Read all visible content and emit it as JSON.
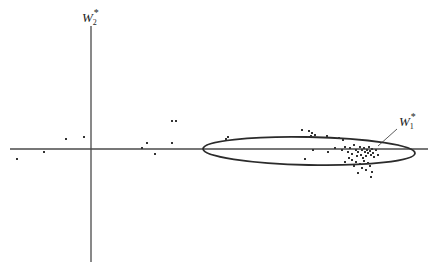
{
  "diagram": {
    "type": "scatter-with-ellipse",
    "axes": {
      "horizontal": {
        "x1": 10,
        "x2": 428,
        "y": 149
      },
      "vertical": {
        "x": 91,
        "y1": 26,
        "y2": 262
      },
      "vertical_label": {
        "base": "W",
        "sub": "2",
        "sup": "*"
      }
    },
    "ellipse": {
      "cx": 309,
      "cy": 151,
      "rx": 106,
      "ry": 14,
      "label": {
        "base": "W",
        "sub": "1",
        "sup": "*"
      },
      "pointer": {
        "from": [
          397,
          129
        ],
        "to": [
          378,
          146
        ]
      }
    },
    "points": [
      [
        17,
        159
      ],
      [
        44,
        152
      ],
      [
        66,
        139
      ],
      [
        84,
        137
      ],
      [
        142,
        148
      ],
      [
        147,
        143
      ],
      [
        155,
        154
      ],
      [
        172,
        143
      ],
      [
        172,
        121
      ],
      [
        176,
        121
      ],
      [
        226,
        139
      ],
      [
        228,
        137
      ],
      [
        302,
        130
      ],
      [
        309,
        131
      ],
      [
        312,
        133
      ],
      [
        311,
        136
      ],
      [
        308,
        137
      ],
      [
        315,
        135
      ],
      [
        327,
        136
      ],
      [
        339,
        138
      ],
      [
        343,
        140
      ],
      [
        313,
        150
      ],
      [
        305,
        159
      ],
      [
        328,
        152
      ],
      [
        335,
        148
      ],
      [
        342,
        150
      ],
      [
        345,
        147
      ],
      [
        348,
        152
      ],
      [
        350,
        148
      ],
      [
        352,
        154
      ],
      [
        354,
        145
      ],
      [
        356,
        150
      ],
      [
        357,
        156
      ],
      [
        358,
        152
      ],
      [
        360,
        147
      ],
      [
        361,
        155
      ],
      [
        362,
        150
      ],
      [
        363,
        158
      ],
      [
        364,
        148
      ],
      [
        365,
        152
      ],
      [
        366,
        156
      ],
      [
        367,
        150
      ],
      [
        368,
        153
      ],
      [
        369,
        147
      ],
      [
        370,
        151
      ],
      [
        371,
        155
      ],
      [
        372,
        149
      ],
      [
        373,
        153
      ],
      [
        374,
        157
      ],
      [
        352,
        160
      ],
      [
        356,
        162
      ],
      [
        360,
        164
      ],
      [
        364,
        161
      ],
      [
        368,
        163
      ],
      [
        370,
        166
      ],
      [
        362,
        168
      ],
      [
        366,
        170
      ],
      [
        372,
        172
      ],
      [
        358,
        173
      ],
      [
        371,
        177
      ],
      [
        349,
        158
      ],
      [
        354,
        166
      ],
      [
        345,
        162
      ],
      [
        378,
        155
      ],
      [
        376,
        150
      ]
    ],
    "colors": {
      "line": "#2b2b2b",
      "axis": "#4a4a4a",
      "point": "#333333",
      "background": "#ffffff"
    }
  }
}
